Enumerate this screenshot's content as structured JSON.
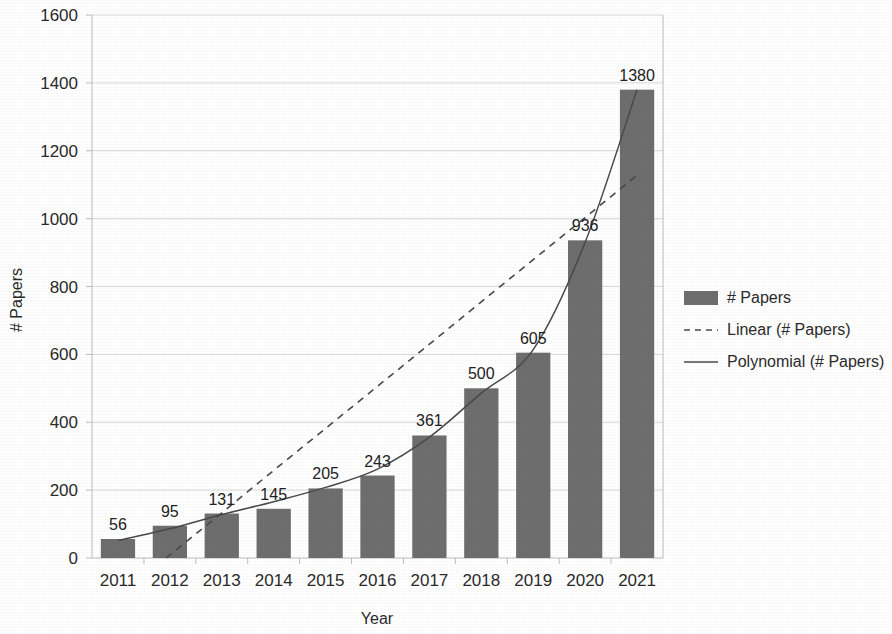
{
  "chart_data": {
    "type": "bar",
    "title": "",
    "subtitle": "",
    "xlabel": "Year",
    "ylabel": "# Papers",
    "categories": [
      "2011",
      "2012",
      "2013",
      "2014",
      "2015",
      "2016",
      "2017",
      "2018",
      "2019",
      "2020",
      "2021"
    ],
    "values": [
      56,
      95,
      131,
      145,
      205,
      243,
      361,
      500,
      605,
      936,
      1380
    ],
    "data_labels": [
      "56",
      "95",
      "131",
      "145",
      "205",
      "243",
      "361",
      "500",
      "605",
      "936",
      "1380"
    ],
    "ylim": [
      0,
      1600
    ],
    "ytick_labels": [
      "0",
      "200",
      "400",
      "600",
      "800",
      "1000",
      "1200",
      "1400",
      "1600"
    ],
    "ytick_values": [
      0,
      200,
      400,
      600,
      800,
      1000,
      1200,
      1400,
      1600
    ],
    "grid": true,
    "legend_position": "right",
    "series": [
      {
        "name": "# Papers",
        "kind": "bar",
        "values": [
          56,
          95,
          131,
          145,
          205,
          243,
          361,
          500,
          605,
          936,
          1380
        ]
      },
      {
        "name": "Linear (# Papers)",
        "kind": "trendline-linear",
        "style": "dashed",
        "values": [
          -115,
          9,
          133,
          258,
          382,
          506,
          630,
          755,
          879,
          1003,
          1128
        ]
      },
      {
        "name": "Polynomial (# Papers)",
        "kind": "trendline-polynomial",
        "style": "solid",
        "values": [
          52,
          86,
          128,
          166,
          208,
          262,
          356,
          486,
          614,
          930,
          1380
        ]
      }
    ],
    "legend": [
      {
        "label": "# Papers",
        "marker": "bar-swatch",
        "color": "#6e6e6e"
      },
      {
        "label": "Linear (# Papers)",
        "marker": "dashed-line",
        "color": "#4a4a4a"
      },
      {
        "label": "Polynomial (# Papers)",
        "marker": "solid-line",
        "color": "#4a4a4a"
      }
    ],
    "colors": {
      "bar": "#6e6e6e",
      "trendline": "#4a4a4a",
      "gridline": "#d9d9d9",
      "text": "#2b2b2b",
      "background": "#ffffff"
    }
  }
}
